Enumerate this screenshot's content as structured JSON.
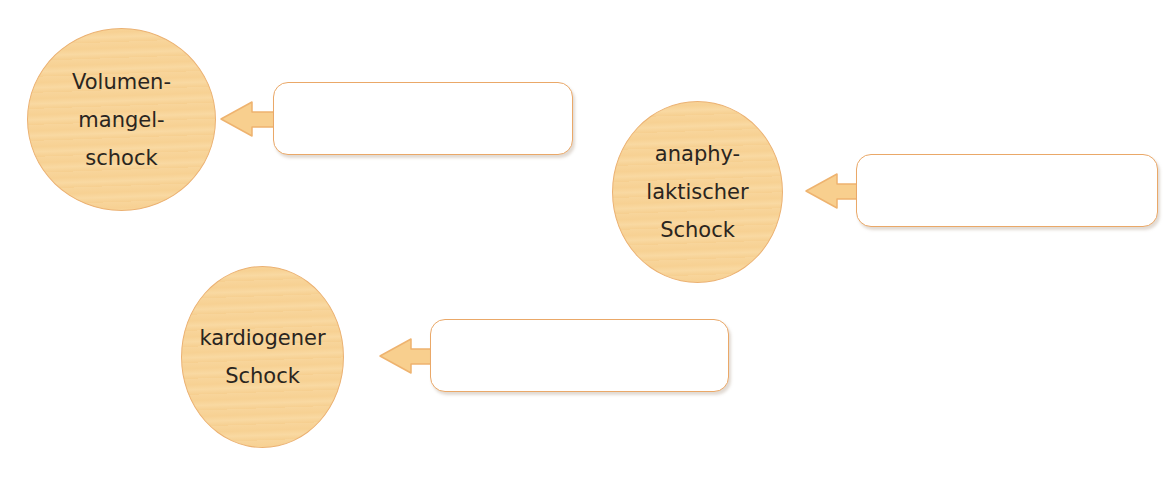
{
  "colors": {
    "circle_fill": "#f8d59b",
    "circle_border": "#ebb172",
    "box_border": "#eaa868",
    "arrow_fill": "#f8cf8e",
    "arrow_stroke": "#eeb36f",
    "text": "#2a2520"
  },
  "nodes": [
    {
      "id": "volumenmangelschock",
      "lines": [
        "Volumen-",
        "mangel-",
        "schock"
      ],
      "answer_box": {
        "value": ""
      }
    },
    {
      "id": "anaphylaktischer-schock",
      "lines": [
        "anaphy-",
        "laktischer",
        "Schock"
      ],
      "answer_box": {
        "value": ""
      }
    },
    {
      "id": "kardiogener-schock",
      "lines": [
        "kardiogener",
        "Schock"
      ],
      "answer_box": {
        "value": ""
      }
    }
  ]
}
